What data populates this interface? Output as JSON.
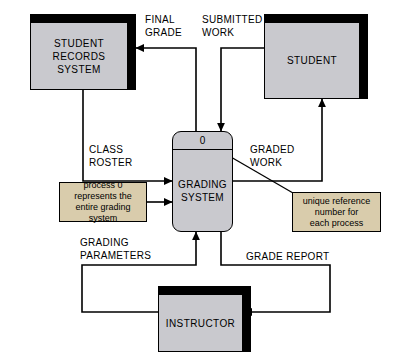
{
  "diagram": {
    "type": "context-level data flow diagram",
    "background_color": "#ffffff",
    "entity_fill_color": "#c9c9ce",
    "process_fill_color": "#c9c9ce",
    "callout_fill_color": "#d9ccac",
    "line_color": "#000000"
  },
  "entities": [
    {
      "id": "student-records-system",
      "label": "STUDENT\nRECORDS\nSYSTEM"
    },
    {
      "id": "student",
      "label": "STUDENT"
    },
    {
      "id": "instructor",
      "label": "INSTRUCTOR"
    }
  ],
  "process": {
    "id": "grading-system",
    "reference_number": "0",
    "label": "GRADING\nSYSTEM"
  },
  "flows": [
    {
      "id": "final-grade",
      "label": "FINAL\nGRADE",
      "from": "grading-system",
      "to": "student-records-system"
    },
    {
      "id": "submitted-work",
      "label": "SUBMITTED\nWORK",
      "from": "student",
      "to": "grading-system"
    },
    {
      "id": "class-roster",
      "label": "CLASS\nROSTER",
      "from": "student-records-system",
      "to": "grading-system"
    },
    {
      "id": "graded-work",
      "label": "GRADED\nWORK",
      "from": "grading-system",
      "to": "student"
    },
    {
      "id": "grading-parameters",
      "label": "GRADING\nPARAMETERS",
      "from": "instructor",
      "to": "grading-system"
    },
    {
      "id": "grade-report",
      "label": "GRADE REPORT",
      "from": "grading-system",
      "to": "instructor"
    }
  ],
  "callouts": [
    {
      "id": "process-zero-note",
      "text": "process 0\nrepresents the\nentire grading system",
      "points_to": "grading-system"
    },
    {
      "id": "reference-number-note",
      "text": "unique reference\nnumber for\neach process",
      "points_to": "process-reference-number"
    }
  ]
}
